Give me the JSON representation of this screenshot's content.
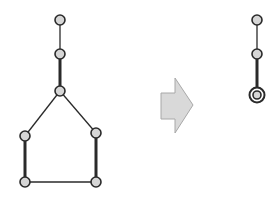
{
  "diagram": {
    "colors": {
      "node_fill": "#d6d6d6",
      "node_stroke": "#2a2a2a",
      "edge": "#2a2a2a",
      "arrow_fill": "#d9d9d9",
      "arrow_stroke": "#a8a8a8"
    },
    "before_graph": {
      "nodes": [
        {
          "id": "a",
          "kind": "normal"
        },
        {
          "id": "b",
          "kind": "normal"
        },
        {
          "id": "c",
          "kind": "normal"
        },
        {
          "id": "d",
          "kind": "normal"
        },
        {
          "id": "e",
          "kind": "normal"
        },
        {
          "id": "f",
          "kind": "normal"
        },
        {
          "id": "g",
          "kind": "normal"
        }
      ],
      "edges": [
        {
          "from": "a",
          "to": "b",
          "weight": "thin"
        },
        {
          "from": "b",
          "to": "c",
          "weight": "thick"
        },
        {
          "from": "c",
          "to": "d",
          "weight": "thin"
        },
        {
          "from": "c",
          "to": "e",
          "weight": "thin"
        },
        {
          "from": "d",
          "to": "f",
          "weight": "thick"
        },
        {
          "from": "e",
          "to": "g",
          "weight": "thick"
        },
        {
          "from": "f",
          "to": "g",
          "weight": "thin"
        }
      ]
    },
    "transform_arrow": {
      "direction": "right"
    },
    "after_graph": {
      "nodes": [
        {
          "id": "a",
          "kind": "normal"
        },
        {
          "id": "b",
          "kind": "normal"
        },
        {
          "id": "c",
          "kind": "contracted"
        }
      ],
      "edges": [
        {
          "from": "a",
          "to": "b",
          "weight": "thin"
        },
        {
          "from": "b",
          "to": "c",
          "weight": "thick"
        }
      ]
    }
  }
}
